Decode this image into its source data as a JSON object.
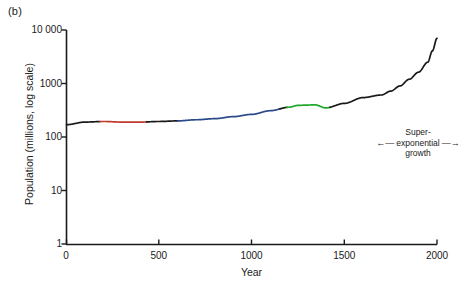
{
  "panel": {
    "label": "(b)"
  },
  "chart_data": {
    "type": "line",
    "title": "",
    "xlabel": "Year",
    "ylabel": "Population (millions, log scale)",
    "xlim": [
      0,
      2000
    ],
    "ylim": [
      1,
      10000
    ],
    "yscale": "log",
    "grid": false,
    "legend": null,
    "xticks": [
      0,
      500,
      1000,
      1500,
      2000
    ],
    "xtick_labels": [
      "0",
      "500",
      "1000",
      "1500",
      "2000"
    ],
    "yticks": [
      1,
      10,
      100,
      1000,
      10000
    ],
    "ytick_labels": [
      "1",
      "10",
      "100",
      "1000",
      "10 000"
    ],
    "series": [
      {
        "name": "World population",
        "color": "#1a1a1a",
        "x": [
          0,
          100,
          200,
          300,
          400,
          500,
          600,
          700,
          800,
          900,
          1000,
          1100,
          1200,
          1250,
          1300,
          1340,
          1400,
          1500,
          1600,
          1700,
          1750,
          1800,
          1850,
          1900,
          1950,
          1975,
          2000
        ],
        "y": [
          170,
          190,
          195,
          190,
          190,
          195,
          200,
          210,
          220,
          240,
          265,
          310,
          360,
          390,
          395,
          400,
          350,
          425,
          545,
          610,
          720,
          900,
          1200,
          1625,
          2500,
          4070,
          7000
        ]
      }
    ],
    "segment_colors": [
      {
        "name": "early-roman-era-red",
        "color": "#c0392b",
        "x_start": 180,
        "x_end": 430
      },
      {
        "name": "medieval-blue",
        "color": "#2b4a8c",
        "x_start": 600,
        "x_end": 1150
      },
      {
        "name": "plague-era-green",
        "color": "#1fa82c",
        "x_start": 1190,
        "x_end": 1420
      }
    ],
    "annotations": [
      {
        "name": "super-exponential-growth",
        "lines": [
          "Super-",
          "exponential",
          "growth"
        ],
        "left_arrow": "←",
        "right_arrow": "→"
      }
    ]
  }
}
